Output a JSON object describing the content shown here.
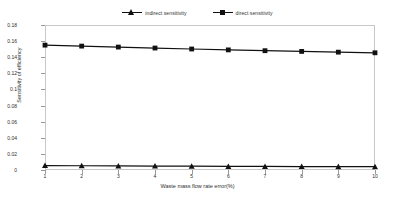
{
  "chart_data": {
    "type": "line",
    "title": "",
    "xlabel": "Waste mass flow rate  error(%)",
    "ylabel": "Sensitivity of efficiency",
    "x": [
      1,
      2,
      3,
      4,
      5,
      6,
      7,
      8,
      9,
      10
    ],
    "xticklabels": [
      "1",
      "2",
      "3",
      "4",
      "5",
      "6",
      "7",
      "8",
      "9",
      "10"
    ],
    "yticklabels": [
      "0",
      "0.02",
      "0.04",
      "0.06",
      "0.08",
      "0.1",
      "0.12",
      "0.14",
      "0.16",
      "0.18"
    ],
    "yticks": [
      0,
      0.02,
      0.04,
      0.06,
      0.08,
      0.1,
      0.12,
      0.14,
      0.16,
      0.18
    ],
    "xlim": [
      1,
      10
    ],
    "ylim": [
      0,
      0.18
    ],
    "grid": false,
    "legend_position": "top-center",
    "series": [
      {
        "name": "indirect sensitivity",
        "marker": "triangle",
        "color": "#111111",
        "values": [
          0.0055,
          0.0053,
          0.0051,
          0.0049,
          0.0047,
          0.0045,
          0.0044,
          0.0043,
          0.0042,
          0.0041
        ]
      },
      {
        "name": "direct sensitivity",
        "marker": "square",
        "color": "#111111",
        "values": [
          0.155,
          0.1538,
          0.1526,
          0.1514,
          0.1502,
          0.1491,
          0.1481,
          0.1472,
          0.1463,
          0.1455
        ]
      }
    ]
  },
  "legend": {
    "items": [
      {
        "label": "indirect sensitivity"
      },
      {
        "label": "direct sensitivity"
      }
    ]
  },
  "colors": {
    "line": "#111111",
    "frame": "#c8c8c8",
    "text": "#2e2e2e",
    "background": "#ffffff"
  }
}
